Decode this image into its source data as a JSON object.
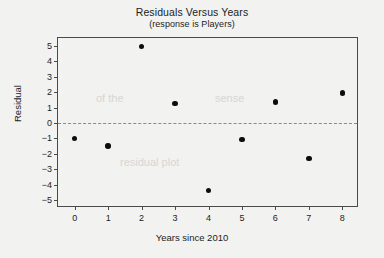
{
  "chart_data": {
    "type": "scatter",
    "title": "Residuals Versus Years",
    "subtitle": "(response is Players)",
    "xlabel": "Years since 2010",
    "ylabel": "Residual",
    "xlim": [
      -0.5,
      8.5
    ],
    "ylim": [
      -5.5,
      5.5
    ],
    "xticks": [
      "0",
      "1",
      "2",
      "3",
      "4",
      "5",
      "6",
      "7",
      "8"
    ],
    "yticks": [
      "5",
      "4",
      "3",
      "2",
      "1",
      "0",
      "-1",
      "-2",
      "-3",
      "-4",
      "-5"
    ],
    "grid": false,
    "legend": null,
    "reference_line": {
      "name": "zero-line",
      "y": 0,
      "style": "dashed",
      "color": "#8a8a8a"
    },
    "marker": {
      "shape": "circle",
      "filled": true,
      "color": "#0d0d0d"
    },
    "x": [
      0,
      1,
      2,
      3,
      4,
      5,
      6,
      7,
      8
    ],
    "values": [
      -1.0,
      -1.5,
      4.95,
      1.25,
      -4.35,
      -1.05,
      1.35,
      -2.3,
      1.95
    ],
    "points": [
      {
        "x": 0,
        "y": -1.0
      },
      {
        "x": 1,
        "y": -1.5
      },
      {
        "x": 2,
        "y": 4.95
      },
      {
        "x": 3,
        "y": 1.25
      },
      {
        "x": 4,
        "y": -4.35
      },
      {
        "x": 5,
        "y": -1.05
      },
      {
        "x": 6,
        "y": 1.35
      },
      {
        "x": 7,
        "y": -2.3
      },
      {
        "x": 8,
        "y": 1.95
      }
    ]
  },
  "background_artifacts": [
    {
      "text": "of the",
      "x": 96,
      "y": 96
    },
    {
      "text": "sense",
      "x": 215,
      "y": 96
    },
    {
      "text": "the",
      "x": 285,
      "y": 96
    },
    {
      "text": "residual plot",
      "x": 120,
      "y": 160
    },
    {
      "text": "pattern",
      "x": 240,
      "y": 160
    }
  ]
}
